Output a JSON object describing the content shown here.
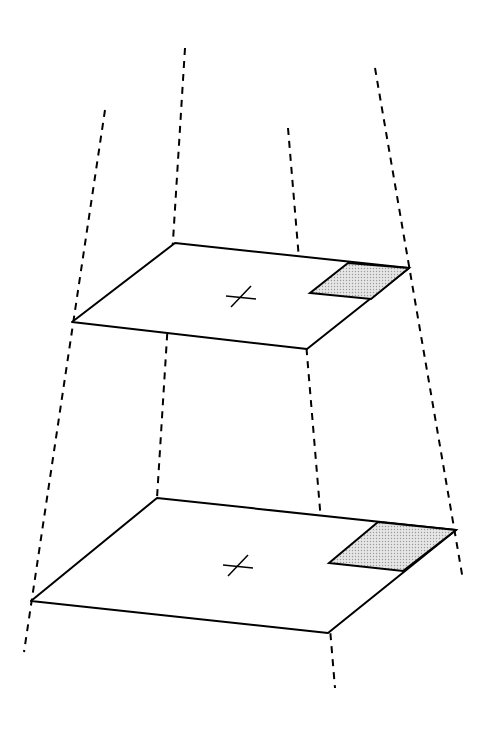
{
  "diagram": {
    "colors": {
      "stroke": "#000000",
      "shade": "#d8d8d8",
      "background": "#ffffff"
    },
    "planes": [
      {
        "name": "upper-plane",
        "corners": [
          [
            72,
            322
          ],
          [
            175,
            243
          ],
          [
            409,
            268
          ],
          [
            307,
            349
          ]
        ],
        "shaded_region": [
          [
            348,
            263
          ],
          [
            409,
            268
          ],
          [
            371,
            299
          ],
          [
            310,
            293
          ]
        ],
        "cross_center": [
          241,
          297
        ]
      },
      {
        "name": "lower-plane",
        "corners": [
          [
            31,
            601
          ],
          [
            157,
            498
          ],
          [
            456,
            530
          ],
          [
            328,
            633
          ]
        ],
        "shaded_region": [
          [
            378,
            522
          ],
          [
            456,
            530
          ],
          [
            403,
            571
          ],
          [
            329,
            563
          ]
        ],
        "cross_center": [
          238,
          566
        ]
      }
    ],
    "projection_lines": [
      {
        "name": "left-front",
        "from": [
          105,
          110
        ],
        "to": [
          24,
          652
        ]
      },
      {
        "name": "left-back",
        "from": [
          185,
          48
        ],
        "to": [
          157,
          498
        ]
      },
      {
        "name": "right-front",
        "from": [
          288,
          128
        ],
        "to": [
          335,
          688
        ]
      },
      {
        "name": "right-back",
        "from": [
          375,
          68
        ],
        "to": [
          463,
          580
        ]
      }
    ]
  }
}
